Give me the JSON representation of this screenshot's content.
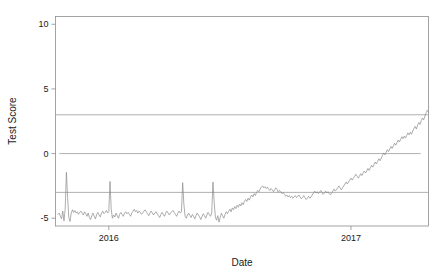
{
  "chart_data": {
    "type": "line",
    "title": "",
    "xlabel": "Date",
    "ylabel": "Test Score",
    "grid": false,
    "legend": "none",
    "xlim": [
      2015.78,
      2017.32
    ],
    "ylim": [
      -5.6,
      10.6
    ],
    "yticks": [
      -5,
      0,
      5,
      10
    ],
    "ytick_labels": [
      "-5",
      "0",
      "5",
      "10"
    ],
    "xticks": [
      2016,
      2017
    ],
    "xtick_labels": [
      "2016",
      "2017"
    ],
    "annotations": [
      {
        "name": "upper-threshold-line",
        "type": "hline",
        "y": 3
      },
      {
        "name": "zero-line",
        "type": "hline",
        "y": 0
      },
      {
        "name": "lower-threshold-line",
        "type": "hline",
        "y": -3
      }
    ],
    "series": [
      {
        "name": "Test Score",
        "color": "#8a8a8a",
        "x": [
          2015.79,
          2015.795,
          2015.8,
          2015.805,
          2015.81,
          2015.815,
          2015.82,
          2015.825,
          2015.83,
          2015.835,
          2015.84,
          2015.845,
          2015.85,
          2015.855,
          2015.86,
          2015.865,
          2015.87,
          2015.875,
          2015.88,
          2015.885,
          2015.89,
          2015.895,
          2015.9,
          2015.905,
          2015.91,
          2015.915,
          2015.92,
          2015.925,
          2015.93,
          2015.935,
          2015.94,
          2015.945,
          2015.95,
          2015.955,
          2015.96,
          2015.965,
          2015.97,
          2015.975,
          2015.98,
          2015.985,
          2015.99,
          2015.995,
          2016.0,
          2016.005,
          2016.01,
          2016.015,
          2016.02,
          2016.025,
          2016.03,
          2016.035,
          2016.04,
          2016.045,
          2016.05,
          2016.055,
          2016.06,
          2016.065,
          2016.07,
          2016.075,
          2016.08,
          2016.085,
          2016.09,
          2016.095,
          2016.1,
          2016.105,
          2016.11,
          2016.115,
          2016.12,
          2016.125,
          2016.13,
          2016.135,
          2016.14,
          2016.145,
          2016.15,
          2016.155,
          2016.16,
          2016.165,
          2016.17,
          2016.175,
          2016.18,
          2016.185,
          2016.19,
          2016.195,
          2016.2,
          2016.205,
          2016.21,
          2016.215,
          2016.22,
          2016.225,
          2016.23,
          2016.235,
          2016.24,
          2016.245,
          2016.25,
          2016.255,
          2016.26,
          2016.265,
          2016.27,
          2016.275,
          2016.28,
          2016.285,
          2016.29,
          2016.295,
          2016.3,
          2016.305,
          2016.31,
          2016.315,
          2016.32,
          2016.325,
          2016.33,
          2016.335,
          2016.34,
          2016.345,
          2016.35,
          2016.355,
          2016.36,
          2016.365,
          2016.37,
          2016.375,
          2016.38,
          2016.385,
          2016.39,
          2016.395,
          2016.4,
          2016.405,
          2016.41,
          2016.415,
          2016.42,
          2016.425,
          2016.43,
          2016.435,
          2016.44,
          2016.445,
          2016.45,
          2016.455,
          2016.46,
          2016.465,
          2016.47,
          2016.475,
          2016.48,
          2016.485,
          2016.49,
          2016.495,
          2016.5,
          2016.505,
          2016.51,
          2016.515,
          2016.52,
          2016.525,
          2016.53,
          2016.535,
          2016.54,
          2016.545,
          2016.55,
          2016.555,
          2016.56,
          2016.565,
          2016.57,
          2016.575,
          2016.58,
          2016.585,
          2016.59,
          2016.595,
          2016.6,
          2016.605,
          2016.61,
          2016.615,
          2016.62,
          2016.625,
          2016.63,
          2016.635,
          2016.64,
          2016.645,
          2016.65,
          2016.655,
          2016.66,
          2016.665,
          2016.67,
          2016.675,
          2016.68,
          2016.685,
          2016.69,
          2016.695,
          2016.7,
          2016.705,
          2016.71,
          2016.715,
          2016.72,
          2016.725,
          2016.73,
          2016.735,
          2016.74,
          2016.745,
          2016.75,
          2016.755,
          2016.76,
          2016.765,
          2016.77,
          2016.775,
          2016.78,
          2016.785,
          2016.79,
          2016.795,
          2016.8,
          2016.805,
          2016.81,
          2016.815,
          2016.82,
          2016.825,
          2016.83,
          2016.835,
          2016.84,
          2016.845,
          2016.85,
          2016.855,
          2016.86,
          2016.865,
          2016.87,
          2016.875,
          2016.88,
          2016.885,
          2016.89,
          2016.895,
          2016.9,
          2016.905,
          2016.91,
          2016.915,
          2016.92,
          2016.925,
          2016.93,
          2016.935,
          2016.94,
          2016.945,
          2016.95,
          2016.955,
          2016.96,
          2016.965,
          2016.97,
          2016.975,
          2016.98,
          2016.985,
          2016.99,
          2016.995,
          2017.0,
          2017.005,
          2017.01,
          2017.015,
          2017.02,
          2017.025,
          2017.03,
          2017.035,
          2017.04,
          2017.045,
          2017.05,
          2017.055,
          2017.06,
          2017.065,
          2017.07,
          2017.075,
          2017.08,
          2017.085,
          2017.09,
          2017.095,
          2017.1,
          2017.105,
          2017.11,
          2017.115,
          2017.12,
          2017.125,
          2017.13,
          2017.135,
          2017.14,
          2017.145,
          2017.15,
          2017.155,
          2017.16,
          2017.165,
          2017.17,
          2017.175,
          2017.18,
          2017.185,
          2017.19,
          2017.195,
          2017.2,
          2017.205,
          2017.21,
          2017.215,
          2017.22,
          2017.225,
          2017.23,
          2017.235,
          2017.24,
          2017.245,
          2017.25
        ],
        "y": [
          -4.7,
          -4.6,
          -4.85,
          -5.05,
          -4.45,
          -5.2,
          -4.3,
          -1.45,
          -3.4,
          -4.95,
          -5.25,
          -4.6,
          -4.35,
          -4.55,
          -4.4,
          -4.6,
          -4.5,
          -4.7,
          -4.55,
          -4.45,
          -4.6,
          -4.75,
          -4.5,
          -4.65,
          -4.85,
          -4.6,
          -4.95,
          -5.1,
          -4.8,
          -4.6,
          -4.85,
          -5.05,
          -4.7,
          -4.55,
          -4.75,
          -4.9,
          -4.6,
          -4.45,
          -4.65,
          -4.55,
          -4.4,
          -4.6,
          -4.5,
          -2.15,
          -4.3,
          -5.0,
          -4.75,
          -4.9,
          -4.6,
          -4.8,
          -5.0,
          -4.7,
          -4.55,
          -4.7,
          -4.85,
          -4.6,
          -4.5,
          -4.65,
          -4.55,
          -4.7,
          -4.85,
          -4.6,
          -4.45,
          -4.3,
          -4.5,
          -4.4,
          -4.6,
          -4.45,
          -4.55,
          -4.7,
          -4.6,
          -4.45,
          -4.35,
          -4.5,
          -4.65,
          -4.8,
          -4.6,
          -4.45,
          -4.6,
          -4.75,
          -4.6,
          -4.5,
          -4.65,
          -4.8,
          -4.95,
          -4.7,
          -4.55,
          -4.7,
          -4.85,
          -4.6,
          -4.45,
          -4.6,
          -4.75,
          -4.6,
          -4.5,
          -4.4,
          -4.55,
          -4.7,
          -4.85,
          -4.6,
          -4.45,
          -4.6,
          -4.5,
          -2.25,
          -3.9,
          -4.85,
          -5.0,
          -4.75,
          -4.6,
          -4.8,
          -4.95,
          -4.7,
          -4.85,
          -5.05,
          -4.8,
          -4.6,
          -4.75,
          -4.9,
          -5.1,
          -4.85,
          -4.65,
          -4.8,
          -5.0,
          -4.75,
          -4.55,
          -4.7,
          -4.85,
          -4.6,
          -2.2,
          -3.7,
          -4.9,
          -5.15,
          -4.8,
          -5.3,
          -4.95,
          -4.6,
          -4.8,
          -5.0,
          -4.7,
          -4.5,
          -4.65,
          -4.45,
          -4.3,
          -4.5,
          -4.2,
          -4.35,
          -4.1,
          -4.25,
          -4.0,
          -4.15,
          -3.9,
          -4.05,
          -3.8,
          -3.95,
          -3.7,
          -3.55,
          -3.7,
          -3.45,
          -3.6,
          -3.35,
          -3.2,
          -3.35,
          -3.1,
          -3.25,
          -3.0,
          -2.85,
          -2.95,
          -2.75,
          -2.6,
          -2.5,
          -2.65,
          -2.55,
          -2.7,
          -2.6,
          -2.75,
          -2.85,
          -2.7,
          -2.8,
          -2.95,
          -2.8,
          -2.65,
          -2.8,
          -3.0,
          -2.85,
          -2.95,
          -3.1,
          -3.0,
          -3.15,
          -3.3,
          -3.2,
          -3.35,
          -3.25,
          -3.4,
          -3.3,
          -3.45,
          -3.35,
          -3.25,
          -3.4,
          -3.3,
          -3.2,
          -3.35,
          -3.5,
          -3.4,
          -3.25,
          -3.4,
          -3.55,
          -3.45,
          -3.3,
          -3.45,
          -3.35,
          -3.2,
          -3.05,
          -2.9,
          -3.05,
          -2.95,
          -3.1,
          -3.0,
          -2.85,
          -3.0,
          -3.15,
          -3.05,
          -2.9,
          -3.05,
          -2.95,
          -3.1,
          -3.2,
          -3.05,
          -2.9,
          -2.75,
          -2.9,
          -2.8,
          -2.65,
          -2.5,
          -2.65,
          -2.8,
          -2.65,
          -2.5,
          -2.35,
          -2.2,
          -2.35,
          -2.2,
          -2.05,
          -1.9,
          -2.05,
          -1.9,
          -1.75,
          -1.6,
          -1.75,
          -1.9,
          -1.75,
          -1.55,
          -1.7,
          -1.5,
          -1.35,
          -1.5,
          -1.35,
          -1.15,
          -1.3,
          -1.1,
          -0.9,
          -1.05,
          -0.85,
          -0.65,
          -0.8,
          -0.6,
          -0.4,
          -0.55,
          -0.35,
          -0.15,
          0.05,
          -0.1,
          0.1,
          0.3,
          0.15,
          0.35,
          0.55,
          0.4,
          0.6,
          0.8,
          0.65,
          0.85,
          1.05,
          0.9,
          1.1,
          1.3,
          1.15,
          1.35,
          1.2,
          1.4,
          1.6,
          1.45,
          1.65,
          1.5
        ]
      }
    ],
    "series_tail": {
      "name": "Test Score (continued)",
      "x": [
        2017.255,
        2017.26,
        2017.265,
        2017.27,
        2017.275,
        2017.28,
        2017.285,
        2017.29,
        2017.295,
        2017.3,
        2017.305,
        2017.31,
        2017.315,
        2017.32
      ],
      "y": [
        1.75,
        1.95,
        2.1,
        1.9,
        2.2,
        2.4,
        2.25,
        2.55,
        2.75,
        2.6,
        2.9,
        3.15,
        3.35,
        3.2
      ]
    }
  }
}
